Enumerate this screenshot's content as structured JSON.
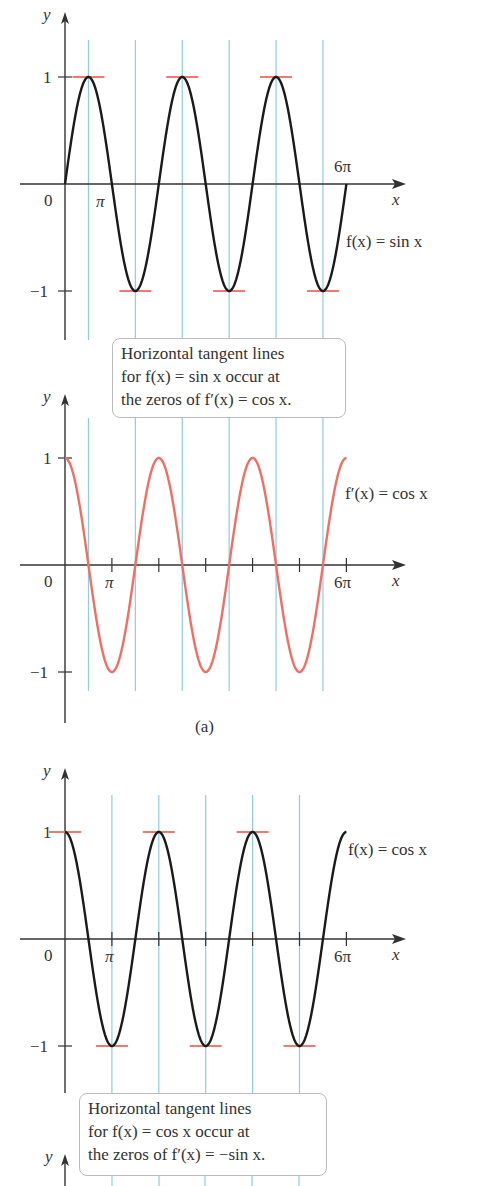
{
  "figure": {
    "caption": "(a)",
    "notes": [
      {
        "lines": [
          "Horizontal tangent lines",
          "for f(x) = sin x occur at",
          "the zeros of f′(x) = cos x."
        ]
      },
      {
        "lines": [
          "Horizontal tangent lines",
          "for f(x) = cos x occur at",
          "the zeros of f′(x) = −sin x."
        ]
      }
    ]
  },
  "colors": {
    "curve_black": "#1a1a1a",
    "curve_red": "#ef6f64",
    "tangent_red": "#f07a70",
    "guide_blue": "#8fcbe6",
    "axis": "#333333"
  },
  "chart_data": [
    {
      "type": "line",
      "title": "f(x) = sin x",
      "series": [
        {
          "name": "f(x) = sin x",
          "function": "sin",
          "x_range": [
            0,
            "6π"
          ],
          "color": "#1a1a1a"
        }
      ],
      "xlabel": "x",
      "ylabel": "y",
      "x_ticks": [
        "0",
        "π",
        "6π"
      ],
      "y_ticks": [
        "1",
        "−1"
      ],
      "ylim": [
        -1,
        1
      ],
      "horizontal_tangents_at": [
        "π/2",
        "3π/2",
        "5π/2",
        "7π/2",
        "9π/2",
        "11π/2"
      ],
      "vertical_guides_at": [
        "π/2",
        "3π/2",
        "5π/2",
        "7π/2",
        "9π/2",
        "11π/2"
      ]
    },
    {
      "type": "line",
      "title": "f′(x) = cos x",
      "series": [
        {
          "name": "f′(x) = cos x",
          "function": "cos",
          "x_range": [
            0,
            "6π"
          ],
          "color": "#ef6f64"
        }
      ],
      "xlabel": "x",
      "ylabel": "y",
      "x_ticks": [
        "0",
        "π",
        "6π"
      ],
      "y_ticks": [
        "1",
        "−1"
      ],
      "ylim": [
        -1,
        1
      ],
      "zeros_at": [
        "π/2",
        "3π/2",
        "5π/2",
        "7π/2",
        "9π/2",
        "11π/2"
      ]
    },
    {
      "type": "line",
      "title": "f(x) = cos x",
      "series": [
        {
          "name": "f(x) = cos x",
          "function": "cos",
          "x_range": [
            0,
            "6π"
          ],
          "color": "#1a1a1a"
        }
      ],
      "xlabel": "x",
      "ylabel": "y",
      "x_ticks": [
        "0",
        "π",
        "6π"
      ],
      "y_ticks": [
        "1",
        "−1"
      ],
      "ylim": [
        -1,
        1
      ],
      "horizontal_tangents_at": [
        "0",
        "π",
        "2π",
        "3π",
        "4π",
        "5π"
      ],
      "vertical_guides_at": [
        "π",
        "2π",
        "3π",
        "4π",
        "5π"
      ]
    }
  ],
  "plots": [
    {
      "ox": 65,
      "oy": 184,
      "amp": 107,
      "fn": "sin",
      "guides": [
        0.5,
        1.5,
        2.5,
        3.5,
        4.5,
        5.5
      ],
      "gtop": 40,
      "gbot": 340,
      "tangents": [
        0.5,
        1.5,
        2.5,
        3.5,
        4.5,
        5.5
      ],
      "ytop": 14,
      "ybot": 340,
      "minorTicks": false,
      "labels": {
        "y": "y",
        "x": "x",
        "zero": "0",
        "pi": "π",
        "sixpi": "6π",
        "one": "1",
        "neg1": "−1",
        "curve": "f(x) = sin x"
      },
      "curveColor": "curve_black",
      "curveLabelPos": [
        346,
        247
      ],
      "sixpiPos": [
        334,
        172
      ],
      "piPos": [
        96,
        207
      ]
    },
    {
      "ox": 65,
      "oy": 565,
      "amp": 107,
      "fn": "cos",
      "guides": [
        0.5,
        1.5,
        2.5,
        3.5,
        4.5,
        5.5
      ],
      "gtop": 418,
      "gbot": 691,
      "tangents": [],
      "ytop": 396,
      "ybot": 723,
      "minorTicks": true,
      "labels": {
        "y": "y",
        "x": "x",
        "zero": "0",
        "pi": "π",
        "sixpi": "6π",
        "one": "1",
        "neg1": "−1",
        "curve": "f′(x) = cos x"
      },
      "curveColor": "curve_red",
      "curveLabelPos": [
        345,
        499
      ],
      "sixpiPos": [
        334,
        588
      ],
      "piPos": [
        105,
        588
      ]
    },
    {
      "ox": 65,
      "oy": 939,
      "amp": 107,
      "fn": "cos",
      "guides": [
        1,
        2,
        3,
        4,
        5
      ],
      "gtop": 795,
      "gbot": 1093,
      "tangents": [
        0,
        1,
        2,
        3,
        4,
        5
      ],
      "ytop": 770,
      "ybot": 1093,
      "minorTicks": true,
      "labels": {
        "y": "y",
        "x": "x",
        "zero": "0",
        "pi": "π",
        "sixpi": "6π",
        "one": "1",
        "neg1": "−1",
        "curve": "f(x) = cos x"
      },
      "curveColor": "curve_black",
      "curveLabelPos": [
        348,
        855
      ],
      "sixpiPos": [
        334,
        962
      ],
      "piPos": [
        105,
        962
      ]
    }
  ]
}
